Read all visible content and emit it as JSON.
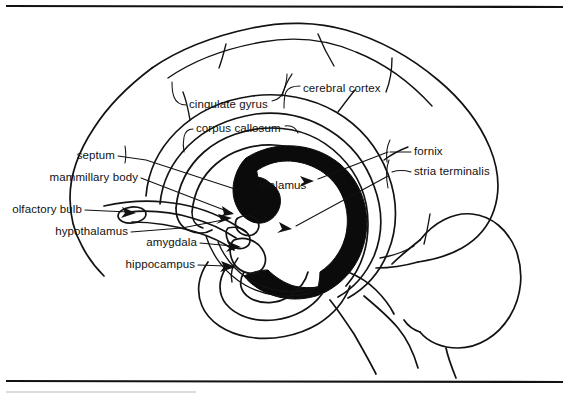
{
  "figure": {
    "background_color": "#ffffff",
    "ink_color": "#121212",
    "width": 569,
    "height": 397,
    "top_rule_y": 6,
    "bottom_rule_y": 381
  },
  "labels": {
    "cerebral_cortex": "cerebral cortex",
    "cingulate_gyrus": "cingulate gyrus",
    "corpus_callosum": "corpus callosum",
    "fornix": "fornix",
    "stria_terminalis": "stria terminalis",
    "septum": "septum",
    "mammillary_body": "mammillary body",
    "olfactory_bulb": "olfactory bulb",
    "hypothalamus": "hypothalamus",
    "amygdala": "amygdala",
    "hippocampus": "hippocampus",
    "thalamus": "thalamus"
  },
  "label_layout": [
    {
      "key": "cerebral_cortex",
      "x": 303,
      "y": 89,
      "align": "left"
    },
    {
      "key": "cingulate_gyrus",
      "x": 189,
      "y": 105,
      "align": "left"
    },
    {
      "key": "corpus_callosum",
      "x": 196,
      "y": 129,
      "align": "left"
    },
    {
      "key": "fornix",
      "x": 414,
      "y": 152,
      "align": "left"
    },
    {
      "key": "stria_terminalis",
      "x": 414,
      "y": 172,
      "align": "left"
    },
    {
      "key": "septum",
      "x": 115,
      "y": 156,
      "align": "right"
    },
    {
      "key": "mammillary_body",
      "x": 138,
      "y": 178,
      "align": "right"
    },
    {
      "key": "olfactory_bulb",
      "x": 82,
      "y": 210,
      "align": "right"
    },
    {
      "key": "hypothalamus",
      "x": 128,
      "y": 232,
      "align": "right"
    },
    {
      "key": "amygdala",
      "x": 197,
      "y": 243,
      "align": "right"
    },
    {
      "key": "hippocampus",
      "x": 195,
      "y": 265,
      "align": "right"
    }
  ],
  "inline_labels": [
    {
      "key": "thalamus",
      "x": 259,
      "y": 186
    }
  ]
}
